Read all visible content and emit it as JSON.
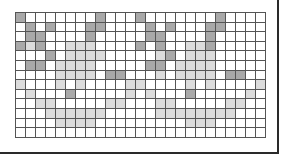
{
  "grid": {
    "rows": 13,
    "cols": 25,
    "legend": {
      "0": "empty",
      "1": "light-shaded",
      "2": "dark-shaded"
    },
    "colors": {
      "empty": "#ffffff",
      "light": "#dcdcdc",
      "dark": "#a9a9a9",
      "line": "#555555",
      "frame": "#2a2a2a"
    },
    "cells": [
      [
        2,
        0,
        0,
        0,
        0,
        0,
        0,
        0,
        2,
        0,
        0,
        0,
        2,
        0,
        0,
        0,
        0,
        0,
        0,
        0,
        2,
        0,
        0,
        0,
        0
      ],
      [
        0,
        2,
        0,
        2,
        0,
        0,
        0,
        2,
        2,
        0,
        0,
        0,
        0,
        2,
        0,
        2,
        0,
        0,
        0,
        2,
        2,
        0,
        0,
        0,
        0
      ],
      [
        0,
        2,
        2,
        0,
        0,
        0,
        0,
        2,
        0,
        0,
        0,
        0,
        0,
        2,
        2,
        0,
        0,
        0,
        0,
        2,
        0,
        0,
        0,
        0,
        0
      ],
      [
        2,
        1,
        2,
        0,
        0,
        1,
        1,
        1,
        0,
        0,
        0,
        0,
        2,
        0,
        2,
        0,
        0,
        1,
        1,
        2,
        0,
        0,
        0,
        0,
        0
      ],
      [
        0,
        0,
        0,
        2,
        0,
        1,
        1,
        1,
        1,
        0,
        0,
        0,
        0,
        0,
        1,
        2,
        0,
        1,
        1,
        1,
        0,
        0,
        0,
        0,
        0
      ],
      [
        0,
        2,
        2,
        0,
        1,
        1,
        1,
        1,
        0,
        0,
        0,
        0,
        0,
        2,
        2,
        0,
        1,
        1,
        1,
        1,
        0,
        0,
        0,
        0,
        0
      ],
      [
        0,
        0,
        0,
        0,
        1,
        1,
        1,
        1,
        0,
        2,
        2,
        0,
        0,
        0,
        1,
        0,
        1,
        1,
        1,
        1,
        0,
        2,
        2,
        0,
        0
      ],
      [
        1,
        0,
        0,
        0,
        1,
        0,
        1,
        0,
        0,
        0,
        0,
        1,
        1,
        0,
        0,
        0,
        0,
        1,
        0,
        1,
        0,
        0,
        0,
        0,
        1
      ],
      [
        0,
        1,
        0,
        0,
        0,
        2,
        0,
        0,
        0,
        0,
        0,
        1,
        0,
        1,
        0,
        0,
        0,
        2,
        0,
        0,
        0,
        0,
        0,
        1,
        0
      ],
      [
        0,
        0,
        1,
        1,
        0,
        0,
        0,
        0,
        0,
        1,
        1,
        0,
        0,
        0,
        1,
        1,
        0,
        0,
        0,
        0,
        0,
        1,
        1,
        0,
        0
      ],
      [
        0,
        0,
        0,
        1,
        1,
        1,
        1,
        1,
        1,
        0,
        0,
        0,
        0,
        0,
        1,
        1,
        1,
        1,
        1,
        1,
        1,
        1,
        0,
        0,
        0
      ],
      [
        0,
        0,
        0,
        0,
        1,
        1,
        1,
        1,
        0,
        0,
        0,
        0,
        0,
        0,
        0,
        0,
        0,
        1,
        1,
        1,
        0,
        0,
        0,
        0,
        0
      ],
      [
        0,
        0,
        0,
        0,
        0,
        0,
        0,
        0,
        0,
        0,
        0,
        0,
        0,
        0,
        0,
        0,
        0,
        0,
        0,
        0,
        0,
        0,
        0,
        0,
        0
      ]
    ]
  }
}
